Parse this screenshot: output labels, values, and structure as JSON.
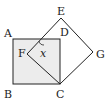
{
  "diagram": {
    "type": "geometry",
    "fill_color": "#ececec",
    "stroke_color": "#222222",
    "points": {
      "A": {
        "label": "A",
        "x": 13,
        "y": 39
      },
      "B": {
        "label": "B",
        "x": 13,
        "y": 84
      },
      "C": {
        "label": "C",
        "x": 60,
        "y": 84
      },
      "D": {
        "label": "D",
        "x": 60,
        "y": 39
      },
      "E": {
        "label": "E",
        "x": 61,
        "y": 18
      },
      "F": {
        "label": "F",
        "x": 27,
        "y": 54
      },
      "G": {
        "label": "G",
        "x": 93,
        "y": 52
      }
    },
    "angle_label": "x"
  }
}
